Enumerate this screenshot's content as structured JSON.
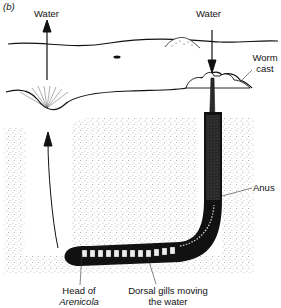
{
  "panel_label": "(b)",
  "labels": {
    "water_out": "Water",
    "water_in": "Water",
    "worm_cast_line1": "Worm",
    "worm_cast_line2": "cast",
    "anus": "Anus",
    "head_line1": "Head of",
    "head_line2": "Arenicola",
    "gills_line1": "Dorsal gills moving",
    "gills_line2": "the water"
  },
  "colors": {
    "ink": "#111111",
    "sediment": "#9a9a9a",
    "background": "#ffffff"
  }
}
